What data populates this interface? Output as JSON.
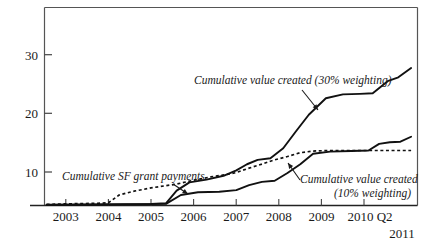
{
  "chart_data": {
    "type": "line",
    "title": "",
    "subtitle": "",
    "xlabel": "",
    "ylabel": "",
    "xlim": [
      2002.5,
      2011.25
    ],
    "ylim": [
      0,
      36
    ],
    "grid": false,
    "legend_position": "inline-annotations",
    "y_ticks": [
      10,
      20,
      30
    ],
    "y_tick_labels": [
      "10",
      "20",
      "30"
    ],
    "x_ticks": [
      2003,
      2004,
      2005,
      2006,
      2007,
      2008,
      2009,
      2010
    ],
    "x_tick_labels": [
      "2003",
      "2004",
      "2005",
      "2006",
      "2007",
      "2008",
      "2009",
      "2010 Q2"
    ],
    "x_axis_end_label": "2011",
    "series": [
      {
        "name": "Cumulative SF grant payments",
        "style": "dotted",
        "color": "#111111",
        "x": [
          2002.55,
          2003.0,
          2003.4,
          2003.75,
          2004.0,
          2004.25,
          2004.6,
          2005.0,
          2005.35,
          2005.6,
          2006.0,
          2006.4,
          2006.75,
          2007.0,
          2007.3,
          2007.55,
          2007.9,
          2008.2,
          2008.5,
          2008.8,
          2009.2,
          2009.7,
          2010.2,
          2010.75,
          2011.1
        ],
        "values": [
          0.2,
          0.3,
          0.35,
          0.4,
          0.5,
          1.9,
          2.6,
          3.2,
          3.6,
          3.9,
          4.6,
          5.2,
          5.6,
          6.0,
          6.8,
          7.4,
          8.3,
          8.9,
          9.6,
          9.9,
          10.0,
          10.0,
          10.0,
          10.0,
          10.0
        ]
      },
      {
        "name": "Cumulative value created (30% weighting)",
        "style": "solid",
        "color": "#111111",
        "x": [
          2002.55,
          2003.5,
          2004.4,
          2005.0,
          2005.35,
          2005.6,
          2005.9,
          2006.3,
          2006.7,
          2007.0,
          2007.25,
          2007.5,
          2007.8,
          2008.1,
          2008.4,
          2008.7,
          2009.1,
          2009.5,
          2009.9,
          2010.2,
          2010.55,
          2010.8,
          2011.1
        ],
        "values": [
          0.15,
          0.2,
          0.25,
          0.3,
          0.4,
          2.7,
          4.2,
          4.7,
          5.4,
          6.4,
          7.5,
          8.3,
          8.6,
          10.4,
          13.5,
          16.5,
          19.5,
          20.2,
          20.3,
          20.4,
          22.6,
          23.3,
          25.0
        ]
      },
      {
        "name": "Cumulative value created (10% weighting)",
        "style": "solid",
        "color": "#111111",
        "x": [
          2002.55,
          2003.5,
          2004.4,
          2005.0,
          2005.35,
          2005.7,
          2006.1,
          2006.6,
          2007.0,
          2007.3,
          2007.6,
          2007.9,
          2008.2,
          2008.5,
          2008.8,
          2009.2,
          2009.7,
          2010.1,
          2010.35,
          2010.6,
          2010.85,
          2011.1
        ],
        "values": [
          0.1,
          0.15,
          0.2,
          0.25,
          0.3,
          1.9,
          2.4,
          2.5,
          2.8,
          3.7,
          4.3,
          4.5,
          5.9,
          7.5,
          9.4,
          9.8,
          9.9,
          10.0,
          11.2,
          11.5,
          11.6,
          12.5
        ]
      }
    ],
    "annotations": [
      {
        "id": "annotation-sf-grant-payments",
        "text": "Cumulative SF grant payments",
        "x": 62,
        "y": 180,
        "anchor": "start",
        "arrow_from": [
          173,
          184
        ],
        "arrow_to": [
          188,
          194
        ]
      },
      {
        "id": "annotation-value-created-30",
        "text": "Cumulative value created (30% weighting)",
        "x": 194,
        "y": 84,
        "anchor": "start",
        "arrow_from": [
          302,
          90
        ],
        "arrow_to": [
          318,
          110
        ]
      },
      {
        "id": "annotation-value-created-10-line1",
        "text": "Cumulative value created",
        "x": 300,
        "y": 183,
        "anchor": "start",
        "arrow_from": [
          300,
          180
        ],
        "arrow_to": [
          288,
          163
        ]
      },
      {
        "id": "annotation-value-created-10-line2",
        "text": "(10% weighting)",
        "x": 334,
        "y": 197,
        "anchor": "start",
        "arrow_from": null,
        "arrow_to": null
      }
    ]
  },
  "axis": {
    "y_label_10": "10",
    "y_label_20": "20",
    "y_label_30": "30",
    "x_label_2003": "2003",
    "x_label_2004": "2004",
    "x_label_2005": "2005",
    "x_label_2006": "2006",
    "x_label_2007": "2007",
    "x_label_2008": "2008",
    "x_label_2009": "2009",
    "x_label_2010q2": "2010 Q2",
    "x_label_2011": "2011"
  },
  "annotations_text": {
    "sf_grant": "Cumulative SF grant payments",
    "value30": "Cumulative value created (30% weighting)",
    "value10_line1": "Cumulative value created",
    "value10_line2": "(10% weighting)"
  },
  "colors": {
    "line": "#111111",
    "frame": "#555555",
    "text": "#1a1a1a",
    "background": "#ffffff"
  }
}
